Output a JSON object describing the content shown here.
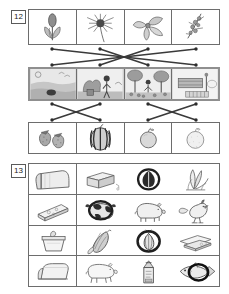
{
  "page": {
    "background": "#ffffff",
    "ink": "#4a4a4a"
  },
  "exercises": [
    {
      "number": "12",
      "type": "matching",
      "instruction_visible": false,
      "rows": [
        {
          "name": "flowers-row",
          "style": "plain",
          "cells": [
            {
              "icon": "tulip-bud-icon",
              "label": "tulip"
            },
            {
              "icon": "dandelion-flower-icon",
              "label": "dandelion"
            },
            {
              "icon": "leafy-blossom-icon",
              "label": "blossom"
            },
            {
              "icon": "sprig-berries-icon",
              "label": "berry sprig"
            }
          ]
        },
        {
          "name": "season-scenes-row",
          "style": "shaded",
          "cells": [
            {
              "icon": "beach-scene-icon",
              "label": "summer beach"
            },
            {
              "icon": "garden-scene-icon",
              "label": "spring garden"
            },
            {
              "icon": "harvest-scene-icon",
              "label": "autumn harvest"
            },
            {
              "icon": "winter-scene-icon",
              "label": "winter"
            }
          ]
        },
        {
          "name": "fruits-row",
          "style": "plain",
          "cells": [
            {
              "icon": "strawberries-icon",
              "label": "strawberries"
            },
            {
              "icon": "watermelon-icon",
              "label": "watermelon"
            },
            {
              "icon": "apple-icon",
              "label": "apple"
            },
            {
              "icon": "orange-icon",
              "label": "orange"
            }
          ]
        }
      ],
      "connectors_top": [
        {
          "from": 0,
          "to": 3
        },
        {
          "from": 1,
          "to": 2
        },
        {
          "from": 2,
          "to": 1
        },
        {
          "from": 3,
          "to": 0
        }
      ],
      "connectors_bottom": [
        {
          "from": 0,
          "to": 1
        },
        {
          "from": 1,
          "to": 0
        },
        {
          "from": 2,
          "to": 3
        },
        {
          "from": 3,
          "to": 2
        }
      ]
    },
    {
      "number": "13",
      "type": "grid",
      "instruction_visible": false,
      "grid": [
        [
          {
            "icon": "bread-loaf-icon",
            "label": "bread loaf",
            "marked": false
          },
          {
            "icon": "butter-block-icon",
            "label": "butter",
            "marked": false
          },
          {
            "icon": "circled-item-icon",
            "label": "circled item",
            "marked": true
          },
          {
            "icon": "leek-plant-icon",
            "label": "leek",
            "marked": false
          }
        ],
        [
          {
            "icon": "cheese-wedge-icon",
            "label": "cheese wedge",
            "marked": false
          },
          {
            "icon": "cow-icon",
            "label": "cow",
            "marked": true
          },
          {
            "icon": "pig-icon",
            "label": "pig",
            "marked": false
          },
          {
            "icon": "rooster-icon",
            "label": "rooster",
            "marked": false
          }
        ],
        [
          {
            "icon": "yogurt-cup-icon",
            "label": "yogurt cup",
            "marked": false
          },
          {
            "icon": "corn-cob-icon",
            "label": "corn cob",
            "marked": false
          },
          {
            "icon": "circled-onion-icon",
            "label": "circled item",
            "marked": true
          },
          {
            "icon": "cheese-slices-icon",
            "label": "cheese slices",
            "marked": false
          }
        ],
        [
          {
            "icon": "bread-roll-icon",
            "label": "bread roll",
            "marked": false
          },
          {
            "icon": "pig-outline-icon",
            "label": "pig",
            "marked": false
          },
          {
            "icon": "milk-carton-icon",
            "label": "milk carton",
            "marked": false
          },
          {
            "icon": "fish-icon",
            "label": "fish",
            "marked": true
          }
        ]
      ]
    }
  ]
}
